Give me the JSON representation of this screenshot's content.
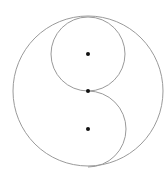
{
  "diagram": {
    "type": "geometric-circles",
    "canvas": {
      "width": 167,
      "height": 178,
      "background": "#ffffff"
    },
    "stroke_color": "#9a9a9a",
    "dot_color": "#111111",
    "outer_circle": {
      "cx": 88,
      "cy": 91,
      "r": 75
    },
    "upper_circle": {
      "cx": 88,
      "cy": 54,
      "r": 37
    },
    "lower_semicircle": {
      "cx": 88,
      "cy": 129,
      "r": 38,
      "side": "right"
    },
    "points": [
      {
        "name": "upper-center",
        "x": 88,
        "y": 54
      },
      {
        "name": "outer-center",
        "x": 88,
        "y": 91
      },
      {
        "name": "lower-center",
        "x": 88,
        "y": 129
      }
    ]
  }
}
